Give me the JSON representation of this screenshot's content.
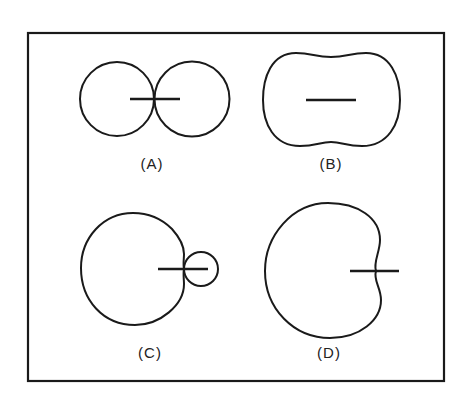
{
  "figure": {
    "frame": {
      "x": 28,
      "y": 33,
      "width": 416,
      "height": 348
    },
    "panels": [
      {
        "id": "A",
        "label": "(A)",
        "pattern_type": "figure-eight",
        "label_pos": {
          "x": 152,
          "y": 165
        }
      },
      {
        "id": "B",
        "label": "(B)",
        "pattern_type": "peanut / broad bidirectional",
        "label_pos": {
          "x": 331,
          "y": 165
        }
      },
      {
        "id": "C",
        "label": "(C)",
        "pattern_type": "large main lobe with small back lobe",
        "label_pos": {
          "x": 150,
          "y": 354
        }
      },
      {
        "id": "D",
        "label": "(D)",
        "pattern_type": "cardioid",
        "label_pos": {
          "x": 329,
          "y": 354
        }
      }
    ]
  }
}
